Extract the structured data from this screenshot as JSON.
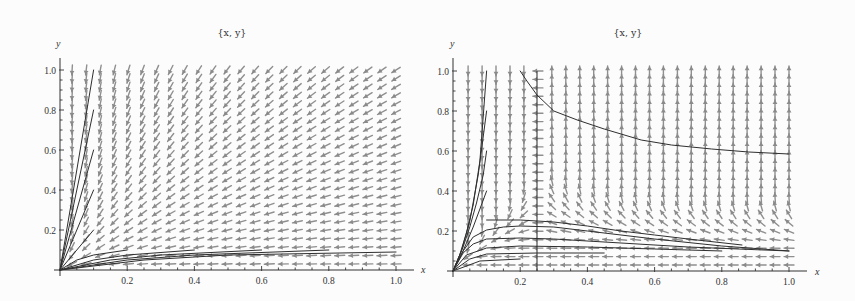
{
  "chart_data": [
    {
      "type": "line",
      "overlay": "vector_field",
      "title": "{x, y}",
      "xlabel": "x",
      "ylabel": "y",
      "xlim": [
        0,
        1.0
      ],
      "ylim": [
        0,
        1.0
      ],
      "xticks": [
        "0.2",
        "0.4",
        "0.6",
        "0.8",
        "1.0"
      ],
      "xtick_values": [
        0.2,
        0.4,
        0.6,
        0.8,
        1.0
      ],
      "yticks": [
        "0.2",
        "0.4",
        "0.6",
        "0.8",
        "1.0"
      ],
      "ytick_values": [
        0.2,
        0.4,
        0.6,
        0.8,
        1.0
      ],
      "grid": false,
      "legend": null,
      "vector_field": {
        "grid_size": [
          24,
          24
        ],
        "color": "#8f8f8f",
        "model": "toward-origin",
        "description": "arrows nearly vertical near x=0, nearly horizontal near y=0, rotating smoothly in between"
      },
      "series": [
        {
          "name": "trajectory 1",
          "points": [
            [
              0,
              0
            ],
            [
              0.1,
              1.0
            ]
          ]
        },
        {
          "name": "trajectory 2",
          "points": [
            [
              0,
              0
            ],
            [
              0.1,
              0.8
            ]
          ]
        },
        {
          "name": "trajectory 3",
          "points": [
            [
              0,
              0
            ],
            [
              0.1,
              0.6
            ]
          ]
        },
        {
          "name": "trajectory 4",
          "points": [
            [
              0,
              0
            ],
            [
              0.1,
              0.4
            ]
          ]
        },
        {
          "name": "trajectory 5",
          "points": [
            [
              0,
              0
            ],
            [
              0.1,
              0.2
            ]
          ]
        },
        {
          "name": "trajectory 6",
          "points": [
            [
              0,
              0
            ],
            [
              0.05,
              0.05
            ],
            [
              0.1,
              0.075
            ],
            [
              0.2,
              0.1
            ]
          ]
        },
        {
          "name": "trajectory 7",
          "points": [
            [
              0,
              0
            ],
            [
              0.1,
              0.05
            ],
            [
              0.2,
              0.075
            ],
            [
              0.4,
              0.1
            ]
          ]
        },
        {
          "name": "trajectory 8",
          "points": [
            [
              0,
              0
            ],
            [
              0.15,
              0.05
            ],
            [
              0.3,
              0.075
            ],
            [
              0.6,
              0.1
            ]
          ]
        },
        {
          "name": "trajectory 9",
          "points": [
            [
              0,
              0
            ],
            [
              0.2,
              0.05
            ],
            [
              0.4,
              0.075
            ],
            [
              0.8,
              0.1
            ]
          ]
        },
        {
          "name": "trajectory 10",
          "points": [
            [
              0,
              0
            ],
            [
              0.25,
              0.05
            ],
            [
              0.5,
              0.075
            ],
            [
              1.0,
              0.09
            ]
          ]
        }
      ]
    },
    {
      "type": "line",
      "overlay": "vector_field",
      "title": "{x, y}",
      "xlabel": "x",
      "ylabel": "y",
      "xlim": [
        0,
        1.0
      ],
      "ylim": [
        0,
        1.0
      ],
      "xticks": [
        "0.2",
        "0.4",
        "0.6",
        "0.8",
        "1.0"
      ],
      "xtick_values": [
        0.2,
        0.4,
        0.6,
        0.8,
        1.0
      ],
      "yticks": [
        "0.2",
        "0.4",
        "0.6",
        "0.8",
        "1.0"
      ],
      "ytick_values": [
        0.2,
        0.4,
        0.6,
        0.8,
        1.0
      ],
      "grid": false,
      "legend": null,
      "vector_field": {
        "grid_size": [
          24,
          24
        ],
        "color": "#8f8f8f",
        "model": "split-at-quarter",
        "description": "arrows vertical in upper region, horizontal along y≈0 and along the line x=0.25, diagonal in the band between"
      },
      "vertical_line": {
        "x": 0.25,
        "y_range": [
          0,
          1.0
        ]
      },
      "series": [
        {
          "name": "upper trajectory",
          "points": [
            [
              0.2,
              1.0
            ],
            [
              0.22,
              0.95
            ],
            [
              0.25,
              0.88
            ],
            [
              0.3,
              0.8
            ],
            [
              0.37,
              0.755
            ],
            [
              0.45,
              0.71
            ],
            [
              0.56,
              0.655
            ],
            [
              0.65,
              0.63
            ],
            [
              0.77,
              0.61
            ],
            [
              0.88,
              0.595
            ],
            [
              1.0,
              0.585
            ]
          ]
        },
        {
          "name": "steep trajectory 1",
          "points": [
            [
              0,
              0
            ],
            [
              0.02,
              0.08
            ],
            [
              0.04,
              0.19
            ],
            [
              0.06,
              0.33
            ],
            [
              0.08,
              0.55
            ],
            [
              0.1,
              1.0
            ]
          ]
        },
        {
          "name": "steep trajectory 2",
          "points": [
            [
              0,
              0
            ],
            [
              0.025,
              0.1
            ],
            [
              0.05,
              0.25
            ],
            [
              0.075,
              0.48
            ],
            [
              0.1,
              0.8
            ]
          ]
        },
        {
          "name": "steep trajectory 3",
          "points": [
            [
              0,
              0
            ],
            [
              0.03,
              0.12
            ],
            [
              0.05,
              0.22
            ],
            [
              0.07,
              0.34
            ],
            [
              0.09,
              0.48
            ],
            [
              0.1,
              0.6
            ]
          ]
        },
        {
          "name": "steep trajectory 4",
          "points": [
            [
              0,
              0
            ],
            [
              0.03,
              0.1
            ],
            [
              0.06,
              0.22
            ],
            [
              0.1,
              0.4
            ]
          ]
        },
        {
          "name": "hump trajectory 1",
          "points": [
            [
              0.1,
              0.255
            ],
            [
              0.2,
              0.255
            ],
            [
              0.3,
              0.245
            ],
            [
              0.4,
              0.225
            ],
            [
              0.5,
              0.2
            ],
            [
              0.6,
              0.18
            ],
            [
              0.7,
              0.16
            ],
            [
              0.86,
              0.13
            ]
          ]
        },
        {
          "name": "hump trajectory 2",
          "points": [
            [
              0,
              0
            ],
            [
              0.03,
              0.1
            ],
            [
              0.06,
              0.17
            ],
            [
              0.1,
              0.205
            ],
            [
              0.15,
              0.22
            ],
            [
              0.2,
              0.225
            ],
            [
              0.3,
              0.22
            ],
            [
              0.4,
              0.2
            ],
            [
              0.6,
              0.16
            ],
            [
              0.8,
              0.125
            ],
            [
              1.0,
              0.1
            ]
          ]
        },
        {
          "name": "hump trajectory 3",
          "points": [
            [
              0,
              0
            ],
            [
              0.03,
              0.09
            ],
            [
              0.06,
              0.135
            ],
            [
              0.1,
              0.16
            ],
            [
              0.2,
              0.165
            ],
            [
              0.3,
              0.16
            ],
            [
              0.5,
              0.14
            ],
            [
              0.7,
              0.12
            ],
            [
              1.0,
              0.1
            ]
          ]
        },
        {
          "name": "hump trajectory 4",
          "points": [
            [
              0,
              0
            ],
            [
              0.04,
              0.08
            ],
            [
              0.1,
              0.115
            ],
            [
              0.2,
              0.125
            ],
            [
              0.4,
              0.12
            ],
            [
              0.6,
              0.11
            ],
            [
              0.8,
              0.1
            ]
          ]
        },
        {
          "name": "hump trajectory 5",
          "points": [
            [
              0,
              0
            ],
            [
              0.05,
              0.06
            ],
            [
              0.1,
              0.085
            ],
            [
              0.25,
              0.09
            ],
            [
              0.45,
              0.09
            ]
          ]
        },
        {
          "name": "hump trajectory 6",
          "points": [
            [
              0,
              0
            ],
            [
              0.08,
              0.05
            ],
            [
              0.2,
              0.06
            ]
          ]
        }
      ]
    }
  ]
}
